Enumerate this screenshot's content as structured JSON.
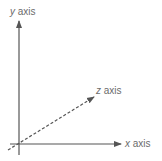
{
  "diagram": {
    "type": "3d-coordinate-axes",
    "colors": {
      "axis_line": "#555555",
      "label_text": "#6b6b6b",
      "background": "#ffffff"
    },
    "axes": {
      "y": {
        "var": "y",
        "word": "axis",
        "style": "solid",
        "direction": "up"
      },
      "x": {
        "var": "x",
        "word": "axis",
        "style": "solid",
        "direction": "right"
      },
      "z": {
        "var": "z",
        "word": "axis",
        "style": "dashed",
        "direction": "diagonal-up-right"
      }
    }
  }
}
